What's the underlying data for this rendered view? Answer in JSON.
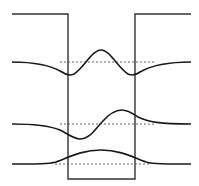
{
  "diagram": {
    "title": "",
    "type": "finite-square-well-wavefunctions",
    "well": {
      "left_wall_x": 68,
      "right_wall_x": 135,
      "top_y": 14,
      "bottom_y": 179,
      "outer_left_x": 12,
      "outer_right_x": 191
    },
    "levels": [
      {
        "n": 3,
        "baseline_y": 62,
        "shape": "even-3-lobes"
      },
      {
        "n": 2,
        "baseline_y": 124,
        "shape": "odd-2-lobes"
      },
      {
        "n": 1,
        "baseline_y": 164,
        "shape": "even-1-lobe"
      }
    ],
    "colors": {
      "line": "#1a1a1a",
      "well": "#333333",
      "dashed": "#555555",
      "background": "#ffffff"
    }
  }
}
